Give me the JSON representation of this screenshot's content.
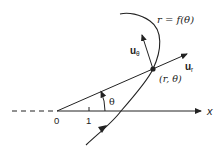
{
  "diagram": {
    "curve_label": "r = f(θ)",
    "point_label": "(r, θ)",
    "unit_vector_r": "u",
    "unit_vector_r_sub": "r",
    "unit_vector_theta": "u",
    "unit_vector_theta_sub": "θ",
    "angle_label": "θ",
    "axis_label": "x",
    "origin_label": "0",
    "tick_label": "1",
    "colors": {
      "stroke": "#222222",
      "background": "#ffffff"
    }
  }
}
